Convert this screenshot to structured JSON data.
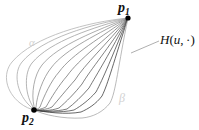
{
  "figure": {
    "type": "math-diagram",
    "width": 199,
    "height": 130,
    "background": "#ffffff"
  },
  "nodes": [
    {
      "id": "p1",
      "label": "p",
      "subscript": "1",
      "x": 128,
      "y": 18,
      "color": "#000000",
      "radius": 2.6
    },
    {
      "id": "p2",
      "label": "p",
      "subscript": "2",
      "x": 34,
      "y": 110,
      "color": "#000000",
      "radius": 2.8
    }
  ],
  "labels": {
    "p1": "p",
    "p1_sub": "1",
    "p2": "p",
    "p2_sub": "2",
    "homotopy": "H(u, ·)",
    "homotopy_H": "H",
    "homotopy_open": "(",
    "homotopy_u": "u",
    "homotopy_comma": ", ",
    "homotopy_dot": "·",
    "homotopy_close": ")",
    "alpha": "α",
    "beta": "β"
  },
  "leader_line": {
    "name": "callout-leader",
    "from_x": 131,
    "from_y": 53,
    "to_x": 159,
    "to_y": 41,
    "color": "#9a9a9a",
    "width": 0.8
  },
  "curve_family": {
    "count": 13,
    "stroke_min": "#b9b9b9",
    "stroke_max": "#2a2a2a",
    "stroke_width": 0.75,
    "note": "Curves fan out from p2 and reconverge at p1; outer-most pair bounds the lens shape"
  },
  "colors": {
    "ink": "#111111",
    "faint": "#d2d2d2",
    "leader": "#9a9a9a",
    "curve_light": "#b9b9b9",
    "curve_dark": "#2a2a2a"
  }
}
